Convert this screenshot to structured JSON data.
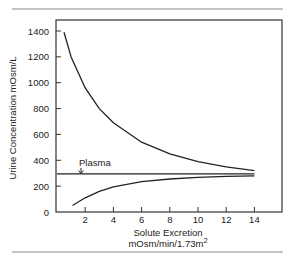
{
  "chart_data": {
    "type": "line",
    "title": "",
    "xlabel": "Solute Excretion",
    "xlabel_units": "mOsm/min/1.73m",
    "xlabel_superscript": "2",
    "ylabel": "Urine Concentration mOsm/L",
    "xlim": [
      0,
      15
    ],
    "ylim": [
      0,
      1400
    ],
    "x_ticks": [
      2,
      4,
      6,
      8,
      10,
      12,
      14
    ],
    "y_ticks": [
      0,
      200,
      400,
      600,
      800,
      1000,
      1200,
      1400
    ],
    "grid": false,
    "series": [
      {
        "name": "Maximum concentration",
        "x": [
          0.5,
          1,
          2,
          3,
          4,
          6,
          8,
          10,
          12,
          14
        ],
        "y": [
          1390,
          1200,
          960,
          800,
          690,
          540,
          450,
          390,
          350,
          320
        ]
      },
      {
        "name": "Minimum (dilution)",
        "x": [
          1.1,
          2,
          3,
          4,
          6,
          8,
          10,
          12,
          14
        ],
        "y": [
          50,
          110,
          160,
          195,
          235,
          255,
          268,
          275,
          280
        ]
      },
      {
        "name": "Plasma",
        "x": [
          0,
          14
        ],
        "y": [
          295,
          295
        ]
      }
    ],
    "annotations": [
      {
        "text": "Plasma",
        "x": 1.8,
        "y": 295,
        "arrow": "down"
      }
    ]
  }
}
